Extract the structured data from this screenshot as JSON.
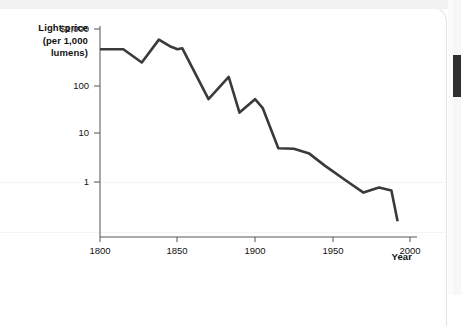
{
  "window": {
    "scrollbar_name": "vertical-scrollbar"
  },
  "chart_data": {
    "type": "line",
    "title": "",
    "ylabel": "Light price\n(per 1,000\nlumens)",
    "ylabel_lines": [
      "Light price",
      "(per 1,000",
      "lumens)"
    ],
    "xlabel": "Year",
    "yscale": "log",
    "ylim": [
      0.15,
      1000
    ],
    "xlim": [
      1800,
      2000
    ],
    "ytick_labels": [
      "$1,000",
      "100",
      "10",
      "1"
    ],
    "ytick_values": [
      1000,
      100,
      10,
      1
    ],
    "xtick_labels": [
      "1800",
      "1850",
      "1900",
      "1950",
      "2000"
    ],
    "xtick_values": [
      1800,
      1850,
      1900,
      1950,
      2000
    ],
    "grid": false,
    "legend": false,
    "line_color": "#3a3a3a",
    "axis_color": "#555555",
    "series": [
      {
        "name": "Light price (per 1,000 lumens)",
        "x": [
          1800,
          1815,
          1827,
          1838,
          1845,
          1850,
          1853,
          1870,
          1883,
          1890,
          1900,
          1905,
          1915,
          1925,
          1935,
          1945,
          1960,
          1970,
          1980,
          1988,
          1992
        ],
        "values": [
          400,
          400,
          220,
          620,
          460,
          400,
          420,
          42,
          115,
          23,
          42,
          28,
          4.6,
          4.5,
          3.6,
          2.1,
          1.0,
          0.62,
          0.78,
          0.68,
          0.17
        ]
      }
    ]
  },
  "labels": {
    "y_line1": "Light price",
    "y_line2": "(per 1,000",
    "y_line3": "lumens)",
    "y_t0": "$1,000",
    "y_t1": "100",
    "y_t2": "10",
    "y_t3": "1",
    "x_t0": "1800",
    "x_t1": "1850",
    "x_t2": "1900",
    "x_t3": "1950",
    "x_t4": "2000",
    "x_axis_title": "Year"
  }
}
